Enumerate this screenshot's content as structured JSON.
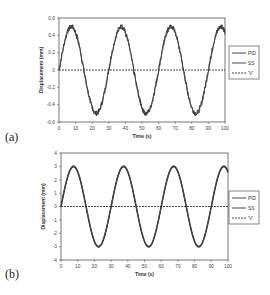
{
  "chart_data": [
    {
      "panel_label": "(a)",
      "type": "line",
      "title": "",
      "xlabel": "Time (s)",
      "ylabel": "Displacement (mm)",
      "xlim": [
        0,
        100
      ],
      "ylim": [
        -0.6,
        0.6
      ],
      "xticks": [
        0,
        10,
        20,
        30,
        40,
        50,
        60,
        70,
        80,
        90,
        100
      ],
      "yticks": [
        -0.6,
        -0.4,
        -0.2,
        0,
        0.2,
        0.4,
        0.6
      ],
      "ytick_labels": [
        "-0.6",
        "-0.4",
        "-0.2",
        "0",
        "0.2",
        "0.4",
        "0.6"
      ],
      "grid": false,
      "legend_position": "right",
      "series": [
        {
          "name": "PID",
          "style": "solid",
          "description": "sinusoid, amplitude ~0.5 mm, period ~30 s, noisy"
        },
        {
          "name": "SS",
          "style": "solid",
          "description": "sinusoid, amplitude ~0.5 mm, period ~30 s, noisy"
        },
        {
          "name": "'V'",
          "style": "dashed",
          "description": "flat at 0"
        }
      ],
      "amplitude": 0.5,
      "period": 30,
      "noisy": true
    },
    {
      "panel_label": "(b)",
      "type": "line",
      "title": "",
      "xlabel": "Time (s)",
      "ylabel": "Displacement (mm)",
      "xlim": [
        0,
        100
      ],
      "ylim": [
        -4,
        4
      ],
      "xticks": [
        0,
        10,
        20,
        30,
        40,
        50,
        60,
        70,
        80,
        90,
        100
      ],
      "yticks": [
        -4,
        -3,
        -2,
        -1,
        0,
        1,
        2,
        3,
        4
      ],
      "ytick_labels": [
        "-4",
        "-3",
        "-2",
        "-1",
        "0",
        "1",
        "2",
        "3",
        "4"
      ],
      "grid": false,
      "legend_position": "right",
      "series": [
        {
          "name": "PID",
          "style": "solid",
          "description": "sinusoid, amplitude ~3 mm, period ~30 s"
        },
        {
          "name": "SS",
          "style": "solid",
          "description": "sinusoid, amplitude ~3 mm, period ~30 s"
        },
        {
          "name": "'V'",
          "style": "dashed",
          "description": "flat at 0"
        }
      ],
      "amplitude": 3,
      "period": 30,
      "noisy": false
    }
  ],
  "labels": {
    "a": "(a)",
    "b": "(b)"
  }
}
